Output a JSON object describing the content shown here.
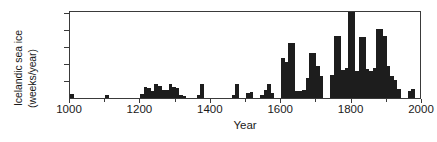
{
  "chart_data": {
    "type": "bar",
    "title": "",
    "subtitle": "",
    "xlabel": "Year",
    "ylabel": "Icelandic sea ice (weeks/year)",
    "ylabel_line1": "Icelandic sea ice",
    "ylabel_line2": "(weeks/year)",
    "xlim": [
      1000,
      2000
    ],
    "ylim": [
      0,
      26
    ],
    "grid": false,
    "legend": null,
    "bin_width": 10,
    "x_major_ticks": [
      1000,
      1200,
      1400,
      1600,
      1800,
      2000
    ],
    "x_major_tick_labels": [
      "1000",
      "1200",
      "1400",
      "1600",
      "1800",
      "2000"
    ],
    "x_minor_ticks": [
      1100,
      1300,
      1500,
      1700,
      1900
    ],
    "y_major_ticks": [
      5,
      15,
      25
    ],
    "y_major_tick_labels": [
      "5",
      "15",
      "25"
    ],
    "y_minor_ticks": [
      10,
      20
    ],
    "bar_color": "#1d1d1d",
    "axis_color": "#3a3a3a",
    "categories": [
      1000,
      1100,
      1200,
      1210,
      1220,
      1230,
      1240,
      1250,
      1260,
      1270,
      1280,
      1290,
      1300,
      1310,
      1320,
      1360,
      1370,
      1460,
      1470,
      1500,
      1510,
      1540,
      1550,
      1560,
      1570,
      1600,
      1610,
      1620,
      1630,
      1640,
      1650,
      1660,
      1670,
      1680,
      1690,
      1700,
      1710,
      1740,
      1750,
      1760,
      1770,
      1780,
      1790,
      1800,
      1810,
      1820,
      1830,
      1840,
      1850,
      1860,
      1870,
      1880,
      1890,
      1900,
      1910,
      1920,
      1930,
      1960,
      1970
    ],
    "values": [
      1.2,
      1.0,
      1.2,
      3.2,
      3.0,
      2.0,
      4.0,
      3.6,
      2.5,
      2.4,
      4.2,
      3.2,
      3.0,
      1.0,
      0.6,
      1.0,
      4.2,
      1.0,
      4.0,
      1.6,
      1.8,
      1.0,
      2.4,
      4.2,
      1.6,
      11.8,
      10.5,
      16.2,
      16.2,
      2.2,
      2.0,
      2.4,
      5.8,
      13.2,
      13.2,
      9.4,
      6.4,
      6.8,
      18.2,
      18.2,
      8.4,
      9.0,
      25.4,
      25.4,
      8.0,
      18.0,
      18.0,
      8.6,
      8.0,
      9.0,
      20.5,
      20.5,
      18.4,
      9.6,
      6.6,
      5.4,
      2.6,
      2.0,
      2.6
    ]
  }
}
